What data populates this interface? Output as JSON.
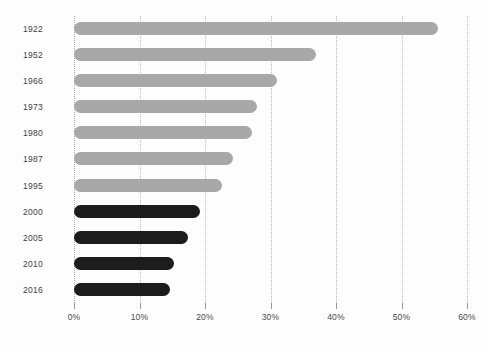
{
  "chart_data": {
    "type": "bar",
    "orientation": "horizontal",
    "title": "",
    "subtitle": "",
    "xlabel": "",
    "ylabel": "",
    "xlim": [
      0,
      60
    ],
    "ylim": null,
    "grid": true,
    "grid_axis": "x",
    "grid_style": "dotted",
    "legend": null,
    "legend_position": "none",
    "categories": [
      "1922",
      "1952",
      "1966",
      "1973",
      "1980",
      "1987",
      "1995",
      "2000",
      "2005",
      "2010",
      "2016"
    ],
    "values": [
      55.5,
      37.0,
      31.0,
      28.0,
      27.2,
      24.2,
      22.6,
      19.2,
      17.4,
      15.3,
      14.7
    ],
    "value_unit": "%",
    "bar_colors": [
      "#a8a8a8",
      "#a8a8a8",
      "#a8a8a8",
      "#a8a8a8",
      "#a8a8a8",
      "#a8a8a8",
      "#a8a8a8",
      "#1c1c1c",
      "#1c1c1c",
      "#1c1c1c",
      "#1c1c1c"
    ],
    "xticks": [
      0,
      10,
      20,
      30,
      40,
      50,
      60
    ],
    "xticklabels": [
      "0%",
      "10%",
      "20%",
      "30%",
      "40%",
      "50%",
      "60%"
    ],
    "yticklabels": [
      "1922",
      "1952",
      "1966",
      "1973",
      "1980",
      "1987",
      "1995",
      "2000",
      "2005",
      "2010",
      "2016"
    ],
    "annotations": []
  },
  "style": {
    "background": "#fdfdfd",
    "grid_color": "#b9b9b9",
    "tick_color": "#9a9a9a",
    "label_color": "#3f3f3f",
    "bar_gray": "#a8a8a8",
    "bar_dark": "#1c1c1c"
  }
}
